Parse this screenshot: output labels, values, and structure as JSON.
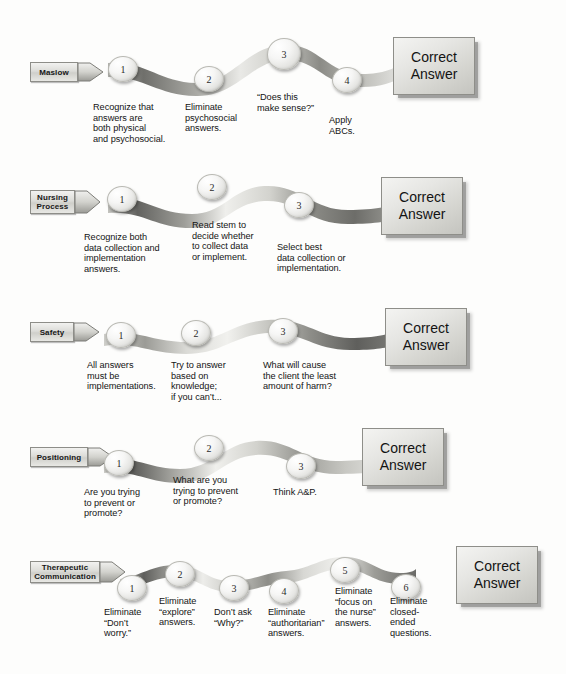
{
  "diagram": {
    "answer_label_line1": "Correct",
    "answer_label_line2": "Answer",
    "colors": {
      "background": "#fdfdfc",
      "ribbon_dark": "#6e6e6a",
      "ribbon_light": "#f2f2f0",
      "text": "#141414",
      "box_border": "#8e8e89"
    },
    "rows": [
      {
        "id": "maslow",
        "label": "Maslow",
        "steps": [
          {
            "num": "1",
            "caption": "Recognize that\nanswers are\nboth physical\nand psychosocial."
          },
          {
            "num": "2",
            "caption": "Eliminate\npsychosocial\nanswers."
          },
          {
            "num": "3",
            "caption": "“Does this\nmake sense?”"
          },
          {
            "num": "4",
            "caption": "Apply\nABCs."
          }
        ]
      },
      {
        "id": "nursing-process",
        "label": "Nursing\nProcess",
        "steps": [
          {
            "num": "1",
            "caption": "Recognize both\ndata collection and\nimplementation\nanswers."
          },
          {
            "num": "2",
            "caption": "Read stem to\ndecide whether\nto collect data\nor implement."
          },
          {
            "num": "3",
            "caption": "Select best\ndata collection or\nimplementation."
          }
        ]
      },
      {
        "id": "safety",
        "label": "Safety",
        "steps": [
          {
            "num": "1",
            "caption": "All answers\nmust be\nimplementations."
          },
          {
            "num": "2",
            "caption": "Try to answer\nbased on\nknowledge;\nif you can’t..."
          },
          {
            "num": "3",
            "caption": "What will cause\nthe client the least\namount of harm?"
          }
        ]
      },
      {
        "id": "positioning",
        "label": "Positioning",
        "steps": [
          {
            "num": "1",
            "caption": "Are you trying\nto prevent or\npromote?"
          },
          {
            "num": "2",
            "caption": "What are you\ntrying to prevent\nor promote?"
          },
          {
            "num": "3",
            "caption": "Think A&P."
          }
        ]
      },
      {
        "id": "therapeutic-communication",
        "label": "Therapeutic\nCommunication",
        "steps": [
          {
            "num": "1",
            "caption": "Eliminate\n“Don’t\nworry.”"
          },
          {
            "num": "2",
            "caption": "Eliminate\n“explore”\nanswers."
          },
          {
            "num": "3",
            "caption": "Don’t ask\n“Why?”"
          },
          {
            "num": "4",
            "caption": "Eliminate\n“authoritarian”\nanswers."
          },
          {
            "num": "5",
            "caption": "Eliminate\n“focus on\nthe nurse”\nanswers."
          },
          {
            "num": "6",
            "caption": "Eliminate\nclosed-\nended\nquestions."
          }
        ]
      }
    ]
  }
}
